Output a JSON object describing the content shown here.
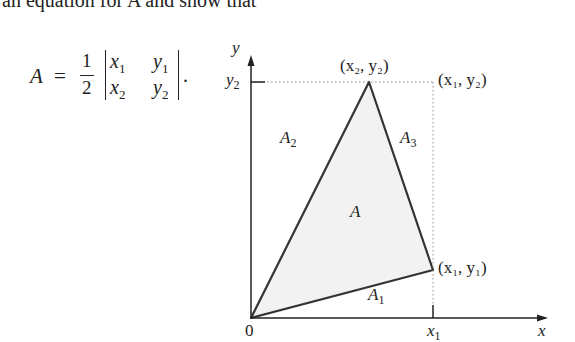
{
  "text": {
    "intro_line": "an equation for A and show that"
  },
  "equation": {
    "lhs": "A",
    "equals": "=",
    "frac_num": "1",
    "frac_den": "2",
    "m11": "x",
    "m11_sub": "1",
    "m12": "y",
    "m12_sub": "1",
    "m21": "x",
    "m21_sub": "2",
    "m22": "y",
    "m22_sub": "2",
    "period": "."
  },
  "figure": {
    "axis_x_label": "x",
    "axis_y_label": "y",
    "origin_label": "0",
    "tick_x1_label": "x",
    "tick_x1_sub": "1",
    "tick_y2_label": "y",
    "tick_y2_sub": "2",
    "point_top": "(x₂, y₂)",
    "point_top_right": "(x₁, y₂)",
    "point_right": "(x₁, y₁)",
    "region_A": "A",
    "region_A1": "A",
    "region_A1_sub": "1",
    "region_A2": "A",
    "region_A2_sub": "2",
    "region_A3": "A",
    "region_A3_sub": "3",
    "colors": {
      "fill": "#f2f2f2",
      "stroke": "#333333",
      "dotted": "#888888"
    }
  }
}
